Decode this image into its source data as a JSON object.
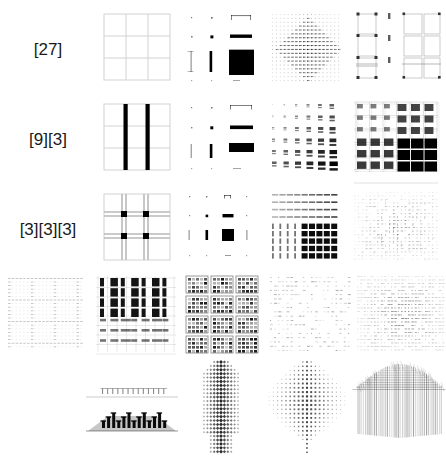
{
  "figure": {
    "title": "",
    "background_color": "#ffffff",
    "ink_color": "#000000",
    "grid_line_color": "#cfcfcf",
    "rows": 5,
    "columns": 5,
    "row_labels": [
      "[27]",
      "[9][3]",
      "[3][3][3]",
      "",
      ""
    ],
    "label_column_index": 0
  },
  "labels": {
    "row1": "[27]",
    "row2": "[9][3]",
    "row3": "[3][3][3]",
    "row4": "",
    "row5": ""
  },
  "chart_data": {
    "type": "heatmap",
    "title": "",
    "xlabel": "",
    "ylabel": "",
    "legend": [],
    "grid": true,
    "row_labels": [
      "[27]",
      "[9][3]",
      "[3][3][3]",
      "",
      ""
    ],
    "column_labels": [
      "1",
      "2",
      "3",
      "4",
      "5"
    ],
    "cells": [
      {
        "row": "[27]",
        "col": 1,
        "pattern": "plain-3x3-grid",
        "density": 0.05,
        "subdivisions": 3,
        "description": "uniform light 3 by 3 grid of thin gray lines"
      },
      {
        "row": "[27]",
        "col": 2,
        "pattern": "scaled-blocks-3x3",
        "density": 0.35,
        "subdivisions": 3,
        "description": "3 by 3 arrangement of marks growing from dots to a solid black square at lower right"
      },
      {
        "row": "[27]",
        "col": 3,
        "pattern": "fine-dotted-lattice",
        "density": 0.18,
        "subdivisions": 9,
        "description": "fine 9 by 9 dotted lattice, darker toward the centre"
      },
      {
        "row": "[27]",
        "col": 4,
        "pattern": "nested-frame-grid",
        "density": 0.22,
        "subdivisions": 3,
        "description": "nested grid of rectangular frames with dark nodes"
      },
      {
        "row": "[9][3]",
        "col": 1,
        "pattern": "grid-two-vertical-bars",
        "density": 0.25,
        "subdivisions": 3,
        "description": "3 by 3 grid with two heavy black vertical bars on the interior gridlines"
      },
      {
        "row": "[9][3]",
        "col": 2,
        "pattern": "scaled-bars-3x3",
        "density": 0.4,
        "subdivisions": 3,
        "description": "3 by 3 arrangement of growing horizontal and vertical bar marks"
      },
      {
        "row": "[9][3]",
        "col": 3,
        "pattern": "block-cluster-lattice",
        "density": 0.45,
        "subdivisions": 6,
        "description": "clustered square blocks increasing in size to the lower right"
      },
      {
        "row": "[9][3]",
        "col": 4,
        "pattern": "dense-quadrant-blocks",
        "density": 0.55,
        "subdivisions": 6,
        "description": "overlaid grid with solid black blocks filling the lower right quadrant"
      },
      {
        "row": "[3][3][3]",
        "col": 1,
        "pattern": "double-grid-nodes",
        "density": 0.2,
        "subdivisions": 3,
        "description": "double gridlines with four solid black squares at the interior intersections"
      },
      {
        "row": "[3][3][3]",
        "col": 2,
        "pattern": "scaled-nodes-4x4",
        "density": 0.3,
        "subdivisions": 4,
        "description": "4 by 4 arrangement of marks growing to a filled square at centre"
      },
      {
        "row": "[3][3][3]",
        "col": 3,
        "pattern": "striped-block-lattice",
        "density": 0.5,
        "subdivisions": 8,
        "description": "vertical stripes with dense black block field at lower right"
      },
      {
        "row": "[3][3][3]",
        "col": 4,
        "pattern": "soft-noise-lattice",
        "density": 0.3,
        "subdivisions": 12,
        "description": "soft grey lattice of small ticks forming a diffuse square"
      },
      {
        "row": "",
        "col": 0,
        "pattern": "faint-grid",
        "density": 0.08,
        "subdivisions": 9,
        "description": "very faint dotted grid"
      },
      {
        "row": "",
        "col": 1,
        "pattern": "heavy-column-grid",
        "density": 0.5,
        "subdivisions": 6,
        "description": "grid with heavy black columns in the upper half"
      },
      {
        "row": "",
        "col": 2,
        "pattern": "tiled-module-grid",
        "density": 0.45,
        "subdivisions": 4,
        "description": "tiled modules each containing a smaller patterned grid"
      },
      {
        "row": "",
        "col": 3,
        "pattern": "sparse-tick-grid",
        "density": 0.15,
        "subdivisions": 10,
        "description": "sparse grey tick lattice"
      },
      {
        "row": "",
        "col": 4,
        "pattern": "dense-tick-noise",
        "density": 0.35,
        "subdivisions": 14,
        "description": "dense grey tick noise field"
      },
      {
        "row": "",
        "col": 1,
        "pattern": "perspective-strips",
        "density": 0.3,
        "subdivisions": 12,
        "description": "two stacked perspective projections, the lower one solid black"
      },
      {
        "row": "",
        "col": 2,
        "pattern": "vertical-diamond-column",
        "density": 0.4,
        "subdivisions": 16,
        "description": "tall vertical column of stacked diamond motifs"
      },
      {
        "row": "",
        "col": 3,
        "pattern": "dotted-hexagon-cloud",
        "density": 0.2,
        "subdivisions": 14,
        "description": "rounded hexagonal cloud of small dots"
      },
      {
        "row": "",
        "col": 4,
        "pattern": "streaked-dome",
        "density": 0.45,
        "subdivisions": 20,
        "description": "dome shaped mass with vertical streaks hanging below"
      }
    ]
  }
}
